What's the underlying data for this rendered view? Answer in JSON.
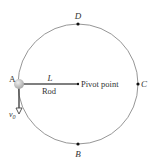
{
  "diagram": {
    "points": {
      "A": "A",
      "B": "B",
      "C": "C",
      "D": "D"
    },
    "rod_length_label": "L",
    "rod_label": "Rod",
    "pivot_label": "Pivot point",
    "velocity_label": "v",
    "velocity_subscript": "0",
    "colors": {
      "circle": "#8a8a8a",
      "rod": "#555555",
      "ball": "#c8c8c8",
      "text": "#333333",
      "dot": "#111111"
    }
  }
}
